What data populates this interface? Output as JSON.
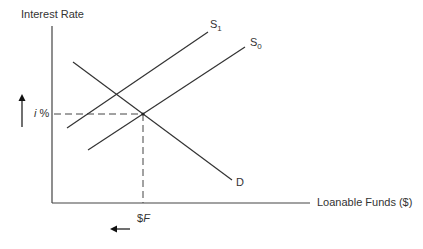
{
  "diagram": {
    "y_axis_label": "Interest Rate",
    "x_axis_label": "Loanable Funds ($)",
    "equilibrium_rate_label": {
      "prefix": "i",
      "suffix": " %"
    },
    "equilibrium_quantity_label": {
      "prefix": "$",
      "suffix": "F"
    },
    "curves": [
      {
        "name": "S",
        "subscript": "1",
        "type": "supply"
      },
      {
        "name": "S",
        "subscript": "0",
        "type": "supply"
      },
      {
        "name": "D",
        "subscript": "",
        "type": "demand"
      }
    ],
    "arrows": [
      {
        "name": "interest-rate-up-arrow",
        "direction": "up"
      },
      {
        "name": "loanable-funds-left-arrow",
        "direction": "left"
      }
    ],
    "colors": {
      "line": "#333333",
      "background": "#ffffff"
    }
  }
}
